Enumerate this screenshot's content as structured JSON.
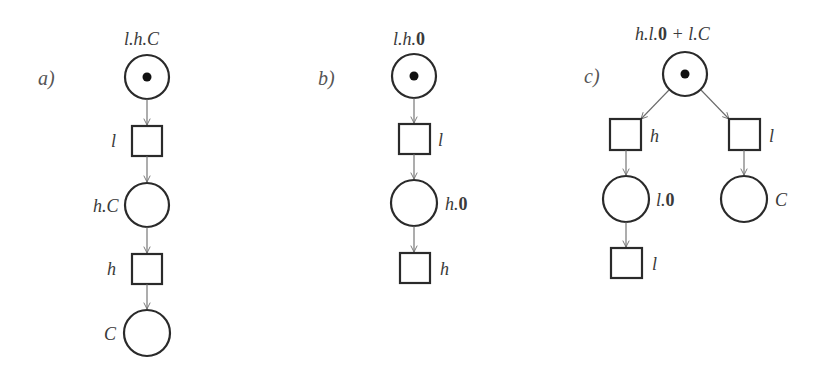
{
  "diagram": {
    "type": "petri-net-figure",
    "colors": {
      "stroke": "#2a2a2a",
      "arc": "#6a6a6a",
      "text": "#3a3a3a",
      "token": "#111111"
    },
    "panels": [
      {
        "id": "a",
        "label": "a)",
        "top_label": {
          "parts": [
            "l.h.C"
          ]
        },
        "nodes": [
          {
            "kind": "place",
            "token": true,
            "label": ""
          },
          {
            "kind": "transition",
            "label": "l"
          },
          {
            "kind": "place",
            "token": false,
            "label": "h.C"
          },
          {
            "kind": "transition",
            "label": "h"
          },
          {
            "kind": "place",
            "token": false,
            "label": "C"
          }
        ]
      },
      {
        "id": "b",
        "label": "b)",
        "top_label": {
          "parts": [
            "l.h.",
            "0"
          ]
        },
        "nodes": [
          {
            "kind": "place",
            "token": true,
            "label": ""
          },
          {
            "kind": "transition",
            "label": "l"
          },
          {
            "kind": "place",
            "token": false,
            "label_parts": [
              "h.",
              "0"
            ]
          },
          {
            "kind": "transition",
            "label": "h"
          }
        ]
      },
      {
        "id": "c",
        "label": "c)",
        "top_label": {
          "parts": [
            "h.l.",
            "0",
            " + l.C"
          ]
        },
        "nodes": [
          {
            "kind": "place",
            "token": true,
            "label": ""
          },
          {
            "kind": "transition",
            "label": "h"
          },
          {
            "kind": "transition",
            "label": "l"
          },
          {
            "kind": "place",
            "token": false,
            "label_parts": [
              "l.",
              "0"
            ]
          },
          {
            "kind": "place",
            "token": false,
            "label": "C"
          },
          {
            "kind": "transition",
            "label": "l"
          }
        ]
      }
    ]
  }
}
